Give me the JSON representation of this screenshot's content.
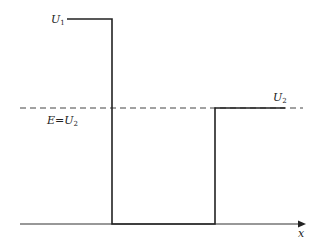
{
  "diagram": {
    "title": "",
    "type": "potential-step-well",
    "colors": {
      "line": "#222222",
      "dashed": "#444444",
      "background": "#ffffff"
    },
    "labels": {
      "u1": {
        "main": "U",
        "sub": "1"
      },
      "u2": {
        "main": "U",
        "sub": "2"
      },
      "energy": {
        "main": "E=U",
        "sub": "2"
      },
      "x_axis": "x"
    },
    "levels": {
      "U1": "high barrier (left)",
      "well": "zero potential region",
      "U2": "step (right), equal to E"
    }
  }
}
